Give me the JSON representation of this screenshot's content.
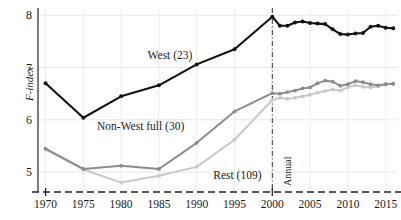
{
  "chart_data": {
    "type": "line",
    "title": "",
    "xlabel": "",
    "ylabel": "F-index",
    "xlim": [
      1969,
      2016.5
    ],
    "ylim": [
      4.62,
      8.1
    ],
    "grid": true,
    "legend_position": "inline-annotations",
    "xticks": [
      1970,
      1975,
      1980,
      1985,
      1990,
      1995,
      2000,
      2005,
      2010,
      2015
    ],
    "xticklabels": [
      "1970",
      "1975",
      "1980",
      "1985",
      "1990",
      "1995",
      "2000",
      "2005",
      "2010",
      "2015"
    ],
    "yticks": [
      5,
      6,
      7,
      8
    ],
    "yticklabels": [
      "5",
      "6",
      "7",
      "8"
    ],
    "annotations": [
      {
        "name": "annual-divider",
        "text": "Annual",
        "x": 2000,
        "style": "vertical-dash-dot"
      }
    ],
    "series": [
      {
        "name": "West (23)",
        "color": "#111111",
        "label": "West (23)",
        "label_x": 1983.5,
        "label_y": 7.22,
        "points": [
          {
            "x": 1970,
            "y": 6.7
          },
          {
            "x": 1975,
            "y": 6.04
          },
          {
            "x": 1980,
            "y": 6.45
          },
          {
            "x": 1985,
            "y": 6.66
          },
          {
            "x": 1990,
            "y": 7.06
          },
          {
            "x": 1995,
            "y": 7.35
          },
          {
            "x": 2000,
            "y": 7.97
          },
          {
            "x": 2001,
            "y": 7.8
          },
          {
            "x": 2002,
            "y": 7.8
          },
          {
            "x": 2003,
            "y": 7.86
          },
          {
            "x": 2004,
            "y": 7.88
          },
          {
            "x": 2005,
            "y": 7.85
          },
          {
            "x": 2006,
            "y": 7.84
          },
          {
            "x": 2007,
            "y": 7.83
          },
          {
            "x": 2008,
            "y": 7.73
          },
          {
            "x": 2009,
            "y": 7.64
          },
          {
            "x": 2010,
            "y": 7.63
          },
          {
            "x": 2011,
            "y": 7.65
          },
          {
            "x": 2012,
            "y": 7.66
          },
          {
            "x": 2013,
            "y": 7.78
          },
          {
            "x": 2014,
            "y": 7.8
          },
          {
            "x": 2015,
            "y": 7.76
          },
          {
            "x": 2016,
            "y": 7.75
          }
        ]
      },
      {
        "name": "Non-West full (30)",
        "color": "#8c8c8c",
        "label": "Non-West full (30)",
        "label_x": 1976.8,
        "label_y": 5.86,
        "points": [
          {
            "x": 1970,
            "y": 5.45
          },
          {
            "x": 1975,
            "y": 5.06
          },
          {
            "x": 1980,
            "y": 5.12
          },
          {
            "x": 1985,
            "y": 5.06
          },
          {
            "x": 1990,
            "y": 5.56
          },
          {
            "x": 1995,
            "y": 6.16
          },
          {
            "x": 2000,
            "y": 6.51
          },
          {
            "x": 2001,
            "y": 6.5
          },
          {
            "x": 2002,
            "y": 6.53
          },
          {
            "x": 2003,
            "y": 6.56
          },
          {
            "x": 2004,
            "y": 6.6
          },
          {
            "x": 2005,
            "y": 6.62
          },
          {
            "x": 2006,
            "y": 6.7
          },
          {
            "x": 2007,
            "y": 6.75
          },
          {
            "x": 2008,
            "y": 6.73
          },
          {
            "x": 2009,
            "y": 6.65
          },
          {
            "x": 2010,
            "y": 6.68
          },
          {
            "x": 2011,
            "y": 6.74
          },
          {
            "x": 2012,
            "y": 6.72
          },
          {
            "x": 2013,
            "y": 6.68
          },
          {
            "x": 2014,
            "y": 6.66
          },
          {
            "x": 2015,
            "y": 6.68
          },
          {
            "x": 2016,
            "y": 6.69
          }
        ]
      },
      {
        "name": "Rest (109)",
        "color": "#c9c9c9",
        "label": "Rest (109)",
        "label_x": 1992.2,
        "label_y": 4.92,
        "points": [
          {
            "x": 1970,
            "y": 5.43
          },
          {
            "x": 1975,
            "y": 5.05
          },
          {
            "x": 1980,
            "y": 4.8
          },
          {
            "x": 1985,
            "y": 4.93
          },
          {
            "x": 1990,
            "y": 5.1
          },
          {
            "x": 1995,
            "y": 5.62
          },
          {
            "x": 2000,
            "y": 6.38
          },
          {
            "x": 2001,
            "y": 6.42
          },
          {
            "x": 2002,
            "y": 6.4
          },
          {
            "x": 2003,
            "y": 6.42
          },
          {
            "x": 2004,
            "y": 6.45
          },
          {
            "x": 2005,
            "y": 6.48
          },
          {
            "x": 2006,
            "y": 6.52
          },
          {
            "x": 2007,
            "y": 6.55
          },
          {
            "x": 2008,
            "y": 6.58
          },
          {
            "x": 2009,
            "y": 6.56
          },
          {
            "x": 2010,
            "y": 6.62
          },
          {
            "x": 2011,
            "y": 6.66
          },
          {
            "x": 2012,
            "y": 6.63
          },
          {
            "x": 2013,
            "y": 6.62
          },
          {
            "x": 2014,
            "y": 6.64
          },
          {
            "x": 2015,
            "y": 6.68
          },
          {
            "x": 2016,
            "y": 6.69
          }
        ]
      }
    ]
  }
}
